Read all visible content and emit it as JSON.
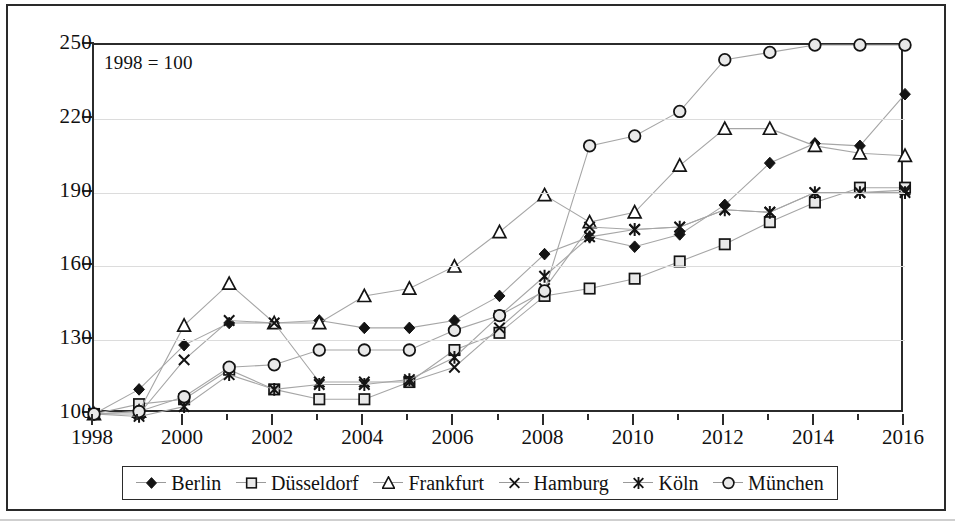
{
  "annotation": {
    "base_note": "1998 = 100"
  },
  "axes": {
    "y_ticks": [
      "100",
      "130",
      "160",
      "190",
      "220",
      "250"
    ],
    "x_labels": [
      "1998",
      "2000",
      "2002",
      "2004",
      "2006",
      "2008",
      "2010",
      "2012",
      "2014",
      "2016"
    ]
  },
  "legend": {
    "items": [
      {
        "label": "Berlin",
        "marker": "diamond-filled-marker",
        "color": "#141414"
      },
      {
        "label": "Düsseldorf",
        "marker": "square-marker",
        "color": "#141414"
      },
      {
        "label": "Frankfurt",
        "marker": "triangle-marker",
        "color": "#141414"
      },
      {
        "label": "Hamburg",
        "marker": "cross-x-marker",
        "color": "#141414"
      },
      {
        "label": "Köln",
        "marker": "asterisk-marker",
        "color": "#141414"
      },
      {
        "label": "München",
        "marker": "circle-marker",
        "color": "#141414"
      }
    ]
  },
  "chart_data": {
    "type": "line",
    "title": "",
    "subtitle": "",
    "xlabel": "",
    "ylabel": "",
    "annotations": [
      "1998 = 100"
    ],
    "grid": true,
    "legend_position": "bottom",
    "xlim": [
      1998,
      2016
    ],
    "ylim": [
      100,
      250
    ],
    "ytick_step": 30,
    "xtick_major_step": 2,
    "xtick_minor_step": 1,
    "x": [
      1998,
      1999,
      2000,
      2001,
      2002,
      2003,
      2004,
      2005,
      2006,
      2007,
      2008,
      2009,
      2010,
      2011,
      2012,
      2013,
      2014,
      2015,
      2016
    ],
    "series": [
      {
        "name": "Berlin",
        "marker": "diamond-filled-marker",
        "values": [
          100,
          110,
          128,
          137,
          137,
          138,
          135,
          135,
          138,
          148,
          165,
          172,
          168,
          173,
          185,
          202,
          210,
          209,
          230
        ]
      },
      {
        "name": "Düsseldorf",
        "marker": "square-marker",
        "values": [
          100,
          104,
          106,
          118,
          110,
          106,
          106,
          113,
          126,
          133,
          148,
          151,
          155,
          162,
          169,
          178,
          186,
          192,
          192
        ]
      },
      {
        "name": "Frankfurt",
        "marker": "triangle-marker",
        "values": [
          100,
          101,
          136,
          153,
          137,
          137,
          148,
          151,
          160,
          174,
          189,
          178,
          182,
          201,
          216,
          216,
          209,
          206,
          205
        ]
      },
      {
        "name": "Hamburg",
        "marker": "cross-x-marker",
        "values": [
          100,
          100,
          122,
          138,
          137,
          113,
          113,
          113,
          119,
          135,
          151,
          176,
          175,
          176,
          183,
          182,
          190,
          190,
          191
        ]
      },
      {
        "name": "Köln",
        "marker": "asterisk-marker",
        "values": [
          100,
          99,
          103,
          116,
          110,
          112,
          112,
          114,
          123,
          140,
          156,
          172,
          175,
          176,
          183,
          182,
          190,
          190,
          190
        ]
      },
      {
        "name": "München",
        "marker": "circle-marker",
        "values": [
          100,
          101,
          107,
          119,
          120,
          126,
          126,
          126,
          134,
          140,
          150,
          209,
          213,
          223,
          244,
          247,
          250,
          250,
          250
        ]
      }
    ]
  }
}
